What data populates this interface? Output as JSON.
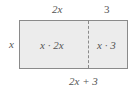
{
  "diagram": {
    "type": "area-model",
    "top_labels": [
      "2x",
      "3"
    ],
    "left_label": "x",
    "cells": [
      "x · 2x",
      "x · 3"
    ],
    "bottom_label": "2x + 3",
    "colors": {
      "fill": "#ececec",
      "border": "#8a8a8a",
      "text": "#555555"
    }
  }
}
